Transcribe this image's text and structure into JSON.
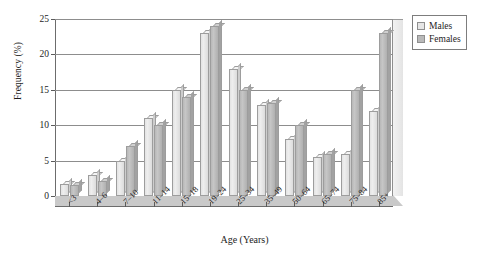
{
  "chart_data": {
    "type": "bar",
    "title": "",
    "xlabel": "Age (Years)",
    "ylabel": "Frequency (%)",
    "ylim": [
      0,
      25
    ],
    "yticks": [
      0,
      5,
      10,
      15,
      20,
      25
    ],
    "grid": true,
    "legend_position": "top-right",
    "categories": [
      "<3",
      "4–6",
      "7–10",
      "11–14",
      "15–18",
      "19–24",
      "25–34",
      "35–49",
      "50–64",
      "65–74",
      "75–84",
      "85+"
    ],
    "series": [
      {
        "name": "Males",
        "color": "#e6e6e6",
        "values": [
          1.7,
          3,
          5,
          11,
          15,
          23,
          18,
          12.8,
          8,
          5.5,
          6,
          12
        ]
      },
      {
        "name": "Females",
        "color": "#b9b9b9",
        "values": [
          1.6,
          2.1,
          7,
          10,
          14,
          24,
          15,
          13.2,
          10,
          6,
          15,
          23
        ]
      }
    ]
  },
  "legend": {
    "items": [
      {
        "label": "Males",
        "color": "#e6e6e6"
      },
      {
        "label": "Females",
        "color": "#b9b9b9"
      }
    ]
  },
  "axes": {
    "x_title": "Age (Years)",
    "y_title": "Frequency (%)"
  }
}
